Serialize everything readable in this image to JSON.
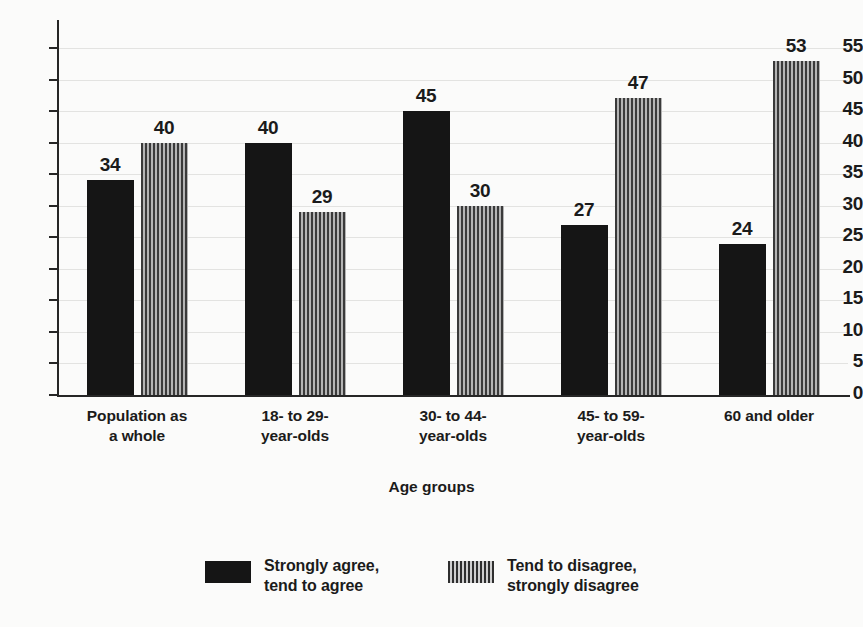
{
  "chart_data": {
    "type": "bar",
    "title": "",
    "xlabel": "Age groups",
    "ylabel": "",
    "ylim": [
      0,
      55
    ],
    "ystep": 5,
    "grid": true,
    "legend_position": "bottom",
    "categories": [
      "Population as\na whole",
      "18- to 29-\nyear-olds",
      "30- to 44-\nyear-olds",
      "45- to 59-\nyear-olds",
      "60 and older"
    ],
    "ytick_labels": [
      "0",
      "5",
      "10",
      "15",
      "20",
      "25",
      "30",
      "35",
      "40",
      "45",
      "50",
      "55"
    ],
    "series": [
      {
        "name": "Strongly agree,\ntend to agree",
        "pattern": "solid",
        "color": "#151515",
        "values": [
          34,
          40,
          45,
          27,
          24
        ]
      },
      {
        "name": "Tend to disagree,\nstrongly disagree",
        "pattern": "vertical-stripes",
        "color": "#6e6e6e",
        "values": [
          40,
          29,
          30,
          47,
          53
        ]
      }
    ],
    "groups": [
      {
        "category": "Population as\na whole",
        "agree": 34,
        "disagree": 40
      },
      {
        "category": "18- to 29-\nyear-olds",
        "agree": 45,
        "disagree": 29
      },
      {
        "category": "30- to 44-\nyear-olds",
        "agree": 40,
        "disagree": 30
      },
      {
        "category": "45- to 59-\nyear-olds",
        "agree": 27,
        "disagree": 47
      },
      {
        "category": "60 and older",
        "agree": 24,
        "disagree": 53
      }
    ]
  },
  "legend": {
    "items": [
      {
        "label": "Strongly agree,\ntend to agree",
        "pattern": "solid"
      },
      {
        "label": "Tend to disagree,\nstrongly disagree",
        "pattern": "striped"
      }
    ]
  }
}
